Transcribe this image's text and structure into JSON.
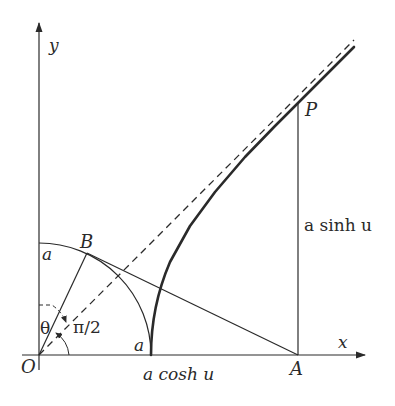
{
  "diagram": {
    "axes": {
      "x_label": "x",
      "y_label": "y",
      "origin_label": "O"
    },
    "points": {
      "O": "O",
      "A": "A",
      "B": "B",
      "P": "P"
    },
    "labels": {
      "radius_on_y_axis": "a",
      "radius_on_x_axis": "a",
      "theta": "θ",
      "right_angle": "π/2",
      "segment_OA": "a cosh u",
      "segment_AP": "a sinh u"
    },
    "elements": [
      "x-axis with arrow",
      "y-axis with arrow",
      "quarter circle of radius a centered at O",
      "dashed asymptote y = x",
      "bold hyperbola branch from (a,0) through P",
      "radius OB",
      "tangent line BA",
      "vertical segment AP",
      "angle arc theta",
      "angle arc pi/2"
    ],
    "colors": {
      "ink": "#2a2a2a",
      "background": "#ffffff"
    }
  }
}
